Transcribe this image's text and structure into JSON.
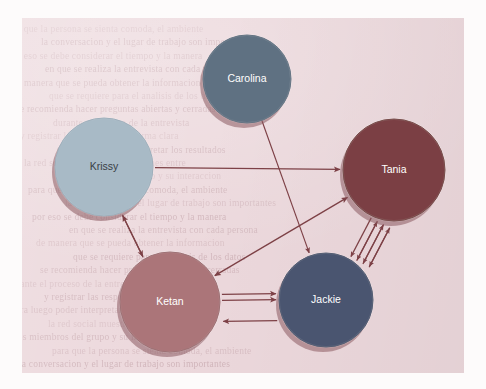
{
  "page": {
    "background_color": "#ecd8dc",
    "margin_color": "#fdfbfb",
    "ghost_text_color": "#b9969d",
    "ghost_lines": [
      "para que la persona se sienta comoda, el ambiente",
      "la conversacion y el lugar de trabajo son importantes",
      "por eso se debe considerar el tiempo y la manera",
      "en que se realiza la entrevista con cada persona",
      "de manera que se pueda obtener la informacion",
      "que se requiere para el analisis de los datos",
      "se recomienda hacer preguntas abiertas y cerradas",
      "durante el proceso de la entrevista",
      "y registrar las respuestas de forma clara",
      "para luego poder interpretar los resultados",
      "la red social muestra las relaciones entre",
      "los miembros del grupo y su interaccion"
    ]
  },
  "diagram": {
    "type": "social-network-graph",
    "nodes": [
      {
        "id": "carolina",
        "label": "Carolina",
        "cx": 247,
        "cy": 79,
        "r": 44,
        "fill": "#5f7182",
        "stroke": "#4d5f70",
        "label_color": "light"
      },
      {
        "id": "krissy",
        "label": "Krissy",
        "cx": 104,
        "cy": 167,
        "r": 49,
        "fill": "#a8bac6",
        "stroke": "#8fa3b1",
        "label_color": "dark"
      },
      {
        "id": "tania",
        "label": "Tania",
        "cx": 394,
        "cy": 170,
        "r": 51,
        "fill": "#7b3f44",
        "stroke": "#63322f",
        "label_color": "light"
      },
      {
        "id": "ketan",
        "label": "Ketan",
        "cx": 170,
        "cy": 302,
        "r": 50,
        "fill": "#ab7579",
        "stroke": "#8f5c60",
        "label_color": "light"
      },
      {
        "id": "jackie",
        "label": "Jackie",
        "cx": 326,
        "cy": 300,
        "r": 47,
        "fill": "#4a5570",
        "stroke": "#3b465e",
        "label_color": "light"
      }
    ],
    "edge_color": "#7d4146",
    "edges": [
      {
        "from": "krissy",
        "to": "tania",
        "direction": "one-way"
      },
      {
        "from": "carolina",
        "to": "jackie",
        "direction": "one-way"
      },
      {
        "from": "krissy",
        "to": "ketan",
        "direction": "two-way"
      },
      {
        "from": "ketan",
        "to": "tania",
        "direction": "two-way"
      },
      {
        "from": "ketan",
        "to": "jackie",
        "direction": "one-way"
      },
      {
        "from": "ketan",
        "to": "jackie",
        "direction": "one-way"
      },
      {
        "from": "jackie",
        "to": "ketan",
        "direction": "one-way"
      },
      {
        "from": "jackie",
        "to": "tania",
        "direction": "one-way"
      },
      {
        "from": "jackie",
        "to": "tania",
        "direction": "one-way"
      },
      {
        "from": "jackie",
        "to": "tania",
        "direction": "one-way"
      },
      {
        "from": "tania",
        "to": "jackie",
        "direction": "one-way"
      },
      {
        "from": "tania",
        "to": "jackie",
        "direction": "one-way"
      },
      {
        "from": "tania",
        "to": "jackie",
        "direction": "one-way"
      },
      {
        "from": "tania",
        "to": "jackie",
        "direction": "one-way"
      }
    ]
  }
}
